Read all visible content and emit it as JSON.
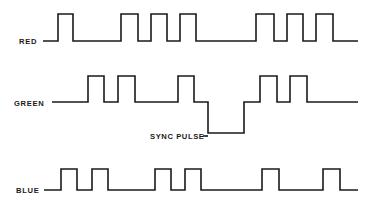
{
  "figure": {
    "background_color": "#ffffff",
    "trace_color": "#1a1a1a",
    "text_color": "#1a1a1a",
    "width": 365,
    "height": 219
  },
  "channels": [
    {
      "name": "red-channel",
      "label": "RED",
      "label_x": 19,
      "label_y": 44,
      "baseline_y": 41,
      "high_y": 14,
      "lead_in_x0": 43,
      "lead_in_x1": 58,
      "trace_end_x": 358,
      "pulses": [
        {
          "start": 58,
          "end": 73
        },
        {
          "start": 121,
          "end": 138
        },
        {
          "start": 151,
          "end": 167
        },
        {
          "start": 180,
          "end": 196
        },
        {
          "start": 256,
          "end": 274
        },
        {
          "start": 287,
          "end": 303
        },
        {
          "start": 316,
          "end": 333
        }
      ]
    },
    {
      "name": "green-channel",
      "label": "GREEN",
      "label_x": 14,
      "label_y": 106,
      "baseline_y": 102,
      "high_y": 76,
      "sync_low_y": 133,
      "lead_in_x0": 52,
      "lead_in_x1": 88,
      "trace_end_x": 358,
      "pulses": [
        {
          "start": 88,
          "end": 104
        },
        {
          "start": 118,
          "end": 135
        },
        {
          "start": 178,
          "end": 194
        },
        {
          "start": 260,
          "end": 277
        },
        {
          "start": 290,
          "end": 307
        }
      ],
      "sync_pulse": {
        "start": 208,
        "end": 244
      }
    },
    {
      "name": "blue-channel",
      "label": "BLUE",
      "label_x": 16,
      "label_y": 193,
      "baseline_y": 190,
      "high_y": 169,
      "lead_in_x0": 44,
      "lead_in_x1": 61,
      "trace_end_x": 358,
      "pulses": [
        {
          "start": 61,
          "end": 77
        },
        {
          "start": 92,
          "end": 108
        },
        {
          "start": 155,
          "end": 171
        },
        {
          "start": 185,
          "end": 201
        },
        {
          "start": 262,
          "end": 279
        },
        {
          "start": 323,
          "end": 340
        }
      ]
    }
  ],
  "annotations": [
    {
      "name": "sync-pulse-label",
      "text": "SYNC PULSE",
      "x": 150,
      "y": 139,
      "leader": {
        "x0": 203,
        "y0": 136,
        "x1": 208,
        "y1": 136
      }
    }
  ],
  "chart_data": {
    "type": "line",
    "xlabel": "",
    "ylabel": "",
    "grid": false,
    "legend": "none",
    "series": [
      {
        "name": "RED",
        "levels": [
          "low",
          "high"
        ],
        "pulse_count": 7,
        "pulse_starts_px": [
          58,
          121,
          151,
          180,
          256,
          287,
          316
        ],
        "pulse_ends_px": [
          73,
          138,
          167,
          196,
          274,
          303,
          333
        ]
      },
      {
        "name": "GREEN",
        "levels": [
          "sync",
          "low",
          "high"
        ],
        "pulse_count": 5,
        "pulse_starts_px": [
          88,
          118,
          178,
          260,
          290
        ],
        "pulse_ends_px": [
          104,
          135,
          194,
          277,
          307
        ],
        "sync_pulse_px": [
          208,
          244
        ]
      },
      {
        "name": "BLUE",
        "levels": [
          "low",
          "high"
        ],
        "pulse_count": 6,
        "pulse_starts_px": [
          61,
          92,
          155,
          185,
          262,
          323
        ],
        "pulse_ends_px": [
          77,
          108,
          171,
          201,
          279,
          340
        ]
      }
    ]
  }
}
